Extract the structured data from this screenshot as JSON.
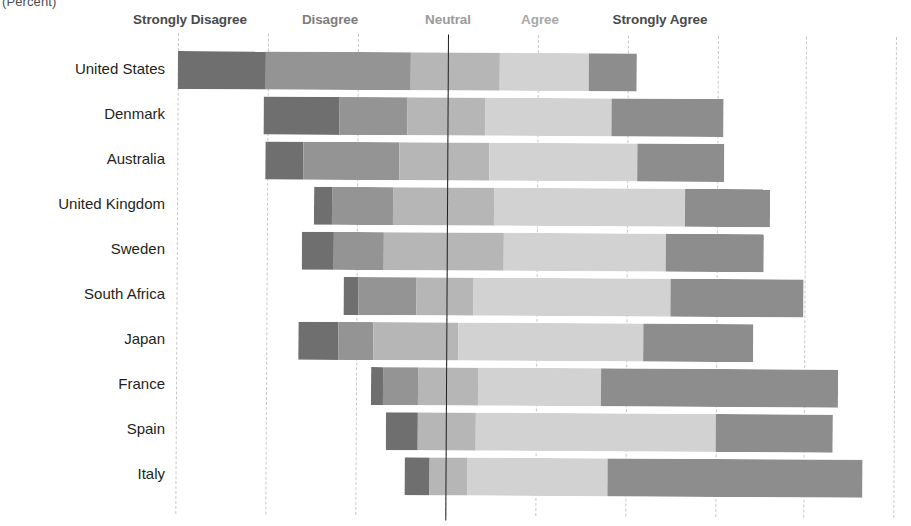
{
  "chart_data": {
    "type": "bar",
    "subtype": "diverging-stacked-bar",
    "title": "",
    "unit_caption": "(Percent)",
    "xlabel": "",
    "ylabel": "",
    "grid": true,
    "grid_style": "dashed-vertical",
    "legend_position": "top",
    "center_reference_line": true,
    "center_reference_note": "Bars are centered on the midpoint of the Neutral segment",
    "categories": [
      "United States",
      "Denmark",
      "Australia",
      "United Kingdom",
      "Sweden",
      "South Africa",
      "Japan",
      "France",
      "Spain",
      "Italy"
    ],
    "legend": [
      "Strongly Disagree",
      "Disagree",
      "Neutral",
      "Agree",
      "Strongly Agree"
    ],
    "colors": {
      "strongly_disagree": "#6f6f6f",
      "disagree": "#949494",
      "neutral": "#b6b6b6",
      "agree": "#d2d2d2",
      "strongly_agree": "#8d8d8d",
      "gridline": "#c9c9c9",
      "centerline": "#231f20",
      "background": "#ffffff",
      "label_text": "#231f20",
      "caption_text": "#4d4d4d"
    },
    "series": [
      {
        "name": "Strongly Disagree",
        "color": "#6f6f6f",
        "values": [
          20,
          17,
          9,
          4,
          7,
          3,
          9,
          3,
          7,
          5
        ]
      },
      {
        "name": "Disagree",
        "color": "#949494",
        "values": [
          33,
          15,
          21,
          14,
          11,
          13,
          8,
          8,
          0,
          0
        ]
      },
      {
        "name": "Neutral",
        "color": "#b6b6b6",
        "values": [
          20,
          17,
          20,
          22,
          27,
          13,
          19,
          13,
          13,
          8
        ]
      },
      {
        "name": "Agree",
        "color": "#d2d2d2",
        "values": [
          33,
          28,
          33,
          42,
          36,
          44,
          41,
          27,
          53,
          31
        ]
      },
      {
        "name": "Strongly Agree",
        "color": "#8d8d8d",
        "values": [
          9,
          25,
          19,
          19,
          22,
          30,
          24,
          53,
          26,
          57
        ]
      }
    ],
    "bar_extents_px": [
      {
        "category": "United States",
        "start": 178,
        "breaks": [
          266,
          411,
          500,
          589
        ],
        "end": 637
      },
      {
        "category": "Denmark",
        "start": 264,
        "breaks": [
          340,
          408,
          486,
          612
        ],
        "end": 724
      },
      {
        "category": "Australia",
        "start": 266,
        "breaks": [
          304,
          400,
          490,
          638
        ],
        "end": 725
      },
      {
        "category": "United Kingdom",
        "start": 315,
        "breaks": [
          333,
          394,
          495,
          686
        ],
        "end": 771
      },
      {
        "category": "Sweden",
        "start": 303,
        "breaks": [
          335,
          385,
          505,
          667
        ],
        "end": 765
      },
      {
        "category": "South Africa",
        "start": 345,
        "breaks": [
          360,
          418,
          475,
          672
        ],
        "end": 805
      },
      {
        "category": "Japan",
        "start": 300,
        "breaks": [
          340,
          375,
          460,
          645
        ],
        "end": 755
      },
      {
        "category": "France",
        "start": 373,
        "breaks": [
          385,
          420,
          480,
          603
        ],
        "end": 840
      },
      {
        "category": "Spain",
        "start": 388,
        "breaks": [
          420,
          420,
          478,
          718
        ],
        "end": 835
      },
      {
        "category": "Italy",
        "start": 407,
        "breaks": [
          432,
          432,
          470,
          610
        ],
        "end": 865
      }
    ],
    "gridline_px": [
      178,
      268,
      358,
      448,
      538,
      628,
      718,
      806,
      896
    ],
    "centerline_px": 448,
    "row_tops_px": [
      18,
      63,
      108,
      153,
      198,
      243,
      288,
      333,
      378,
      423
    ],
    "row_height_px": 38
  },
  "legend_positions_px": [
    190,
    330,
    448,
    540,
    660
  ]
}
